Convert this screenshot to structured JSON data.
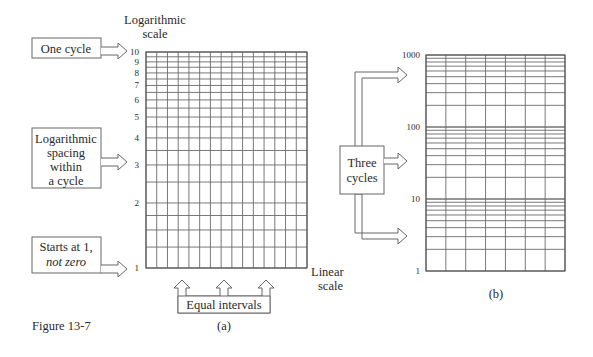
{
  "figure": {
    "caption": "Figure 13-7"
  },
  "panel_a": {
    "sublabel": "(a)",
    "y_axis_title_line1": "Logarithmic",
    "y_axis_title_line2": "scale",
    "x_axis_title_line1": "Linear",
    "x_axis_title_line2": "scale",
    "tick_labels": [
      "1",
      "2",
      "3",
      "4",
      "5",
      "6",
      "7",
      "8",
      "9",
      "10"
    ],
    "columns": 15,
    "callouts": {
      "one_cycle": "One cycle",
      "log_spacing": [
        "Logarithmic",
        "spacing",
        "within",
        "a cycle"
      ],
      "starts_at_1": [
        "Starts at 1,",
        "not zero"
      ],
      "equal_intervals": "Equal intervals"
    }
  },
  "panel_b": {
    "sublabel": "(b)",
    "tick_labels": [
      "1",
      "10",
      "100",
      "1000"
    ],
    "columns": 7,
    "callouts": {
      "three_cycles": [
        "Three",
        "cycles"
      ]
    }
  },
  "chart_data": [
    {
      "type": "grid",
      "title": "(a) Semi-log graph paper, one cycle",
      "xlabel": "Linear scale",
      "ylabel": "Logarithmic scale",
      "y_scale": "log",
      "ylim": [
        1,
        10
      ],
      "y_ticks": [
        1,
        2,
        3,
        4,
        5,
        6,
        7,
        8,
        9,
        10
      ],
      "y_minor_lines": [
        1.25,
        1.5,
        1.75,
        2.5,
        3.5
      ],
      "x_divisions": 15,
      "annotations": [
        "One cycle",
        "Logarithmic spacing within a cycle",
        "Starts at 1, not zero",
        "Equal intervals"
      ]
    },
    {
      "type": "grid",
      "title": "(b) Semi-log graph paper, three cycles",
      "y_scale": "log",
      "ylim": [
        1,
        1000
      ],
      "y_ticks": [
        1,
        10,
        100,
        1000
      ],
      "cycles": 3,
      "x_divisions": 7,
      "annotations": [
        "Three cycles"
      ]
    }
  ]
}
